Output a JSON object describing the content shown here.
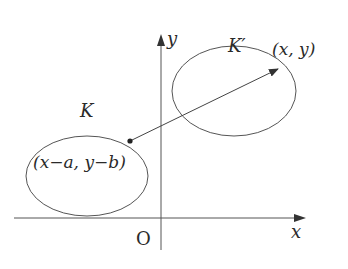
{
  "diagram": {
    "axes": {
      "x_label": "x",
      "y_label": "y",
      "origin_label": "O"
    },
    "regions": [
      {
        "name": "K",
        "label": "K"
      },
      {
        "name": "K-prime",
        "label": "K′"
      }
    ],
    "points": [
      {
        "name": "original-point",
        "label": "(x−a, y−b)",
        "in_region": "K"
      },
      {
        "name": "image-point",
        "label": "(x, y)",
        "in_region": "K-prime"
      }
    ],
    "arrow": {
      "from": "original-point",
      "to": "image-point"
    },
    "colors": {
      "stroke": "#555555",
      "text": "#2a2a2a",
      "background": "#ffffff"
    }
  }
}
